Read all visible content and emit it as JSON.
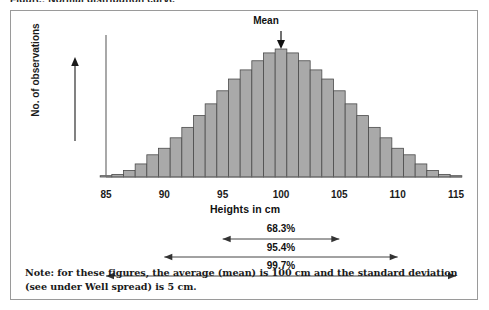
{
  "figure": {
    "caption_sliver": "Figure: Normal distribution curve",
    "note": "Note: for these figures, the average (mean) is 100 cm and the standard deviation (see under Well spread) is 5 cm."
  },
  "annotations": {
    "mean_label": "Mean",
    "intervals": [
      {
        "label": "68.3%",
        "from": 95,
        "to": 105
      },
      {
        "label": "95.4%",
        "from": 90,
        "to": 110
      },
      {
        "label": "99.7%",
        "from": 85,
        "to": 115
      }
    ]
  },
  "colors": {
    "bar_fill": "#a9a9a9",
    "bar_stroke": "#4a4a4a",
    "axis": "#6f6f6f",
    "frame": "#9a9a9a",
    "text": "#1a1a1a"
  },
  "chart_data": {
    "type": "bar",
    "title": "",
    "subtitle": "",
    "xlabel": "Heights in cm",
    "ylabel": "No. of observations",
    "xlim": [
      85,
      115
    ],
    "ylim": [
      0,
      100
    ],
    "grid": false,
    "legend": null,
    "bin_width": 1,
    "tick_labels_x": [
      "85",
      "90",
      "95",
      "100",
      "105",
      "110",
      "115"
    ],
    "tick_values_x": [
      85,
      90,
      95,
      100,
      105,
      110,
      115
    ],
    "categories": [
      85,
      86,
      87,
      88,
      89,
      90,
      91,
      92,
      93,
      94,
      95,
      96,
      97,
      98,
      99,
      100,
      101,
      102,
      103,
      104,
      105,
      106,
      107,
      108,
      109,
      110,
      111,
      112,
      113,
      114,
      115
    ],
    "values": [
      1,
      2,
      5,
      10,
      17,
      22,
      30,
      38,
      47,
      56,
      66,
      75,
      82,
      89,
      95,
      98,
      95,
      89,
      82,
      75,
      66,
      56,
      47,
      38,
      30,
      22,
      17,
      10,
      5,
      2,
      1
    ],
    "annotations": [
      {
        "text": "Mean",
        "x": 100,
        "kind": "arrow-down"
      },
      {
        "text": "68.3%",
        "x_from": 95,
        "x_to": 105,
        "kind": "double-arrow"
      },
      {
        "text": "95.4%",
        "x_from": 90,
        "x_to": 110,
        "kind": "double-arrow"
      },
      {
        "text": "99.7%",
        "x_from": 85,
        "x_to": 115,
        "kind": "double-arrow"
      }
    ]
  }
}
